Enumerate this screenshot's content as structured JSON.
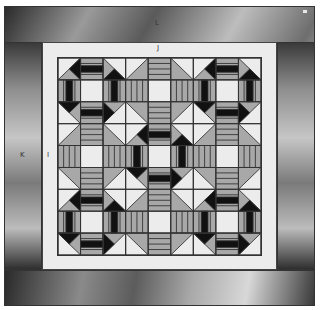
{
  "labels": {
    "outer_top": "L",
    "inner_top": "J",
    "outer_left": "K",
    "inner_left": "I"
  },
  "colors": {
    "light": "#ececec",
    "medium": "#a8a8a8",
    "dark": "#111111",
    "line": "#333333"
  },
  "quilt": {
    "rows": 3,
    "cols": 3,
    "cells_per_block": 3,
    "blocks": [
      [
        "arrow",
        "static",
        "arrow"
      ],
      [
        "static",
        "arrow",
        "static"
      ],
      [
        "arrow",
        "static",
        "arrow"
      ]
    ]
  }
}
